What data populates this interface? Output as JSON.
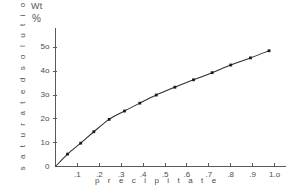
{
  "figure": {
    "unit_label_line1": "Wt",
    "unit_label_line2": "%",
    "y_axis_title": "s a t u r a t e d   s o l u t i o n",
    "x_axis_title": "p r e c i p i t a t e"
  },
  "chart_data": {
    "type": "line",
    "title": "",
    "subtitle": "",
    "xlabel": "precipitate",
    "ylabel": "saturated solution",
    "unit_label": "Wt %",
    "grid": false,
    "legend": null,
    "legend_position": "none",
    "xlim": [
      0,
      1.05
    ],
    "ylim": [
      0,
      55
    ],
    "x_ticks": [
      0.1,
      0.2,
      0.3,
      0.4,
      0.5,
      0.6,
      0.7,
      0.8,
      0.9,
      1.0
    ],
    "x_tick_labels": [
      ".1",
      ".2",
      ".3",
      ".4",
      ".5",
      ".6",
      ".7",
      ".8",
      ".9",
      "1.o"
    ],
    "y_ticks": [
      0,
      10,
      20,
      30,
      40,
      50
    ],
    "y_tick_labels": [
      "0",
      "1o",
      "2o",
      "3o",
      "4o",
      "5o"
    ],
    "series": [
      {
        "name": "saturated solution vs precipitate",
        "marker": "square",
        "x": [
          0.0,
          0.055,
          0.115,
          0.175,
          0.245,
          0.315,
          0.385,
          0.46,
          0.545,
          0.63,
          0.715,
          0.8,
          0.89,
          0.975
        ],
        "y": [
          0.0,
          5.2,
          9.8,
          14.6,
          19.8,
          23.3,
          26.6,
          30.0,
          33.3,
          36.4,
          39.4,
          42.6,
          45.6,
          48.6
        ]
      }
    ]
  }
}
